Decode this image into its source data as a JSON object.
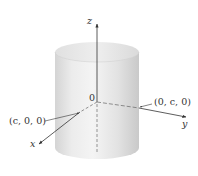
{
  "figure": {
    "type": "cylinder-3d-axes",
    "labels": {
      "z_axis": "z",
      "y_axis": "y",
      "x_axis": "x",
      "origin": "0",
      "point_x": "(c, 0, 0)",
      "point_y": "(0, c, 0)"
    },
    "colors": {
      "cylinder_light": "#f2f2f2",
      "cylinder_mid": "#dcdcdc",
      "cylinder_dark": "#c8c8c8",
      "axis": "#333333"
    }
  }
}
